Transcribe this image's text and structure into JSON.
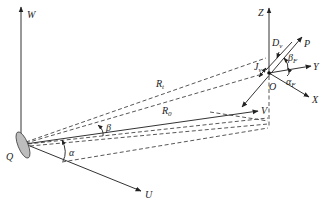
{
  "diagram": {
    "type": "geometry-coordinate-systems",
    "labels": {
      "W": "W",
      "U": "U",
      "V": "V",
      "Q": "Q",
      "Z": "Z",
      "Y": "Y",
      "X": "X",
      "O": "O",
      "P": "P",
      "alpha": "α",
      "beta": "β",
      "R_t": "R",
      "R_t_sub": "t",
      "R_0": "R",
      "R_0_sub": "0",
      "D_v": "D",
      "D_v_sub": "v",
      "J_v": "J",
      "J_v_sub": "v",
      "beta_F": "β",
      "beta_F_sub": "F",
      "alpha_F": "α",
      "alpha_F_sub": "F"
    },
    "colors": {
      "line": "#333333",
      "background": "#ffffff",
      "disk_fill": "#bbbbbb"
    }
  }
}
